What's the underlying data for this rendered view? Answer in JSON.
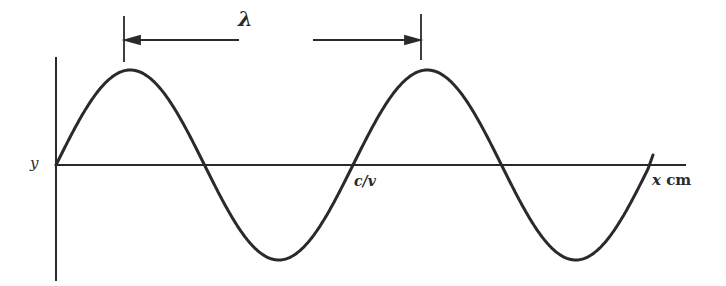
{
  "diagram": {
    "title": "",
    "labels": {
      "y_axis": "y",
      "wavelength": "λ",
      "crossing": "c/v",
      "x_axis_var": "x",
      "x_axis_unit": "cm"
    },
    "colors": {
      "stroke": "#2a2a2a",
      "background": "#ffffff"
    }
  },
  "chart_data": {
    "type": "line",
    "title": "",
    "xlabel": "x cm",
    "ylabel": "y",
    "series": [
      {
        "name": "wave",
        "function": "sine",
        "periods": 2.0,
        "amplitude": 1,
        "phase_at_origin": 0
      }
    ],
    "annotations": [
      {
        "text": "λ",
        "type": "dimension",
        "from": "crest 1",
        "to": "crest 2"
      },
      {
        "text": "c/v",
        "type": "point",
        "at": "zero crossing at x = λ"
      }
    ],
    "grid": false,
    "legend": null
  }
}
